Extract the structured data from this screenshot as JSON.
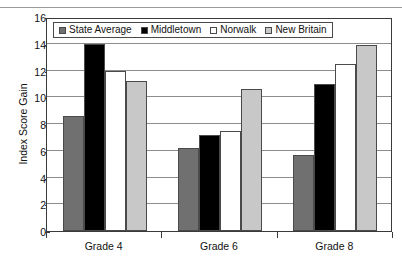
{
  "chart_data": {
    "type": "bar",
    "title": "",
    "subtitle": "",
    "xlabel": "",
    "ylabel": "Index Score Gain",
    "categories": [
      "Grade 4",
      "Grade 6",
      "Grade 8"
    ],
    "ylim": [
      0,
      16
    ],
    "yticks": [
      0,
      2,
      4,
      6,
      8,
      10,
      12,
      14,
      16
    ],
    "ytick_labels": [
      "0",
      "2",
      "4",
      "6",
      "8",
      "10",
      "12",
      "14",
      "16"
    ],
    "grid": true,
    "legend_position": "top-left-inside",
    "series": [
      {
        "name": "State Average",
        "color": "#707070",
        "values": [
          8.6,
          6.2,
          5.7
        ]
      },
      {
        "name": "Middletown",
        "color": "#000000",
        "values": [
          14.0,
          7.2,
          11.0
        ]
      },
      {
        "name": "Norwalk",
        "color": "#ffffff",
        "values": [
          12.0,
          7.5,
          12.5
        ]
      },
      {
        "name": "New Britain",
        "color": "#c8c8c8",
        "values": [
          11.2,
          10.6,
          13.9
        ]
      }
    ]
  }
}
